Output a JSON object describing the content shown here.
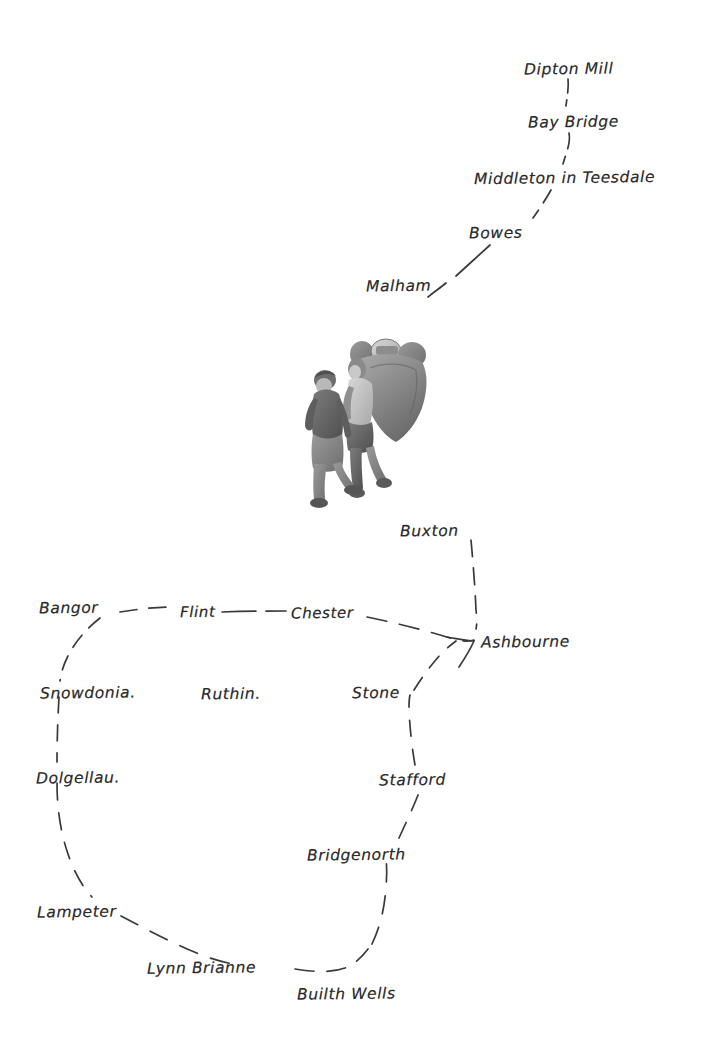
{
  "document": {
    "kind": "hand-drawn-route-map",
    "background_color": "#ffffff",
    "ink_color": "#2b2b2b"
  },
  "illustration": {
    "name": "two-hikers-walking",
    "description": "Two walkers with rucksacks, grayscale sketch",
    "x": 300,
    "y": 336,
    "width": 148,
    "height": 172
  },
  "places": [
    {
      "id": "dipton-mill",
      "label": "Dipton Mill",
      "x": 524,
      "y": 62,
      "anchor": "left"
    },
    {
      "id": "bay-bridge",
      "label": "Bay Bridge",
      "x": 528,
      "y": 115,
      "anchor": "left"
    },
    {
      "id": "middleton-in-teesdale",
      "label": "Middleton in Teesdale",
      "x": 474,
      "y": 171,
      "anchor": "left"
    },
    {
      "id": "bowes",
      "label": "Bowes",
      "x": 469,
      "y": 226,
      "anchor": "left"
    },
    {
      "id": "malham",
      "label": "Malham",
      "x": 366,
      "y": 279,
      "anchor": "left"
    },
    {
      "id": "buxton",
      "label": "Buxton",
      "x": 400,
      "y": 524,
      "anchor": "left"
    },
    {
      "id": "bangor",
      "label": "Bangor",
      "x": 39,
      "y": 601,
      "anchor": "left"
    },
    {
      "id": "flint",
      "label": "Flint",
      "x": 180,
      "y": 605,
      "anchor": "left"
    },
    {
      "id": "chester",
      "label": "Chester",
      "x": 291,
      "y": 606,
      "anchor": "left"
    },
    {
      "id": "ashbourne",
      "label": "Ashbourne",
      "x": 481,
      "y": 635,
      "anchor": "left"
    },
    {
      "id": "snowdonia",
      "label": "Snowdonia.",
      "x": 40,
      "y": 686,
      "anchor": "left"
    },
    {
      "id": "ruthin",
      "label": "Ruthin.",
      "x": 201,
      "y": 687,
      "anchor": "left"
    },
    {
      "id": "stone",
      "label": "Stone",
      "x": 352,
      "y": 686,
      "anchor": "left"
    },
    {
      "id": "dolgellau",
      "label": "Dolgellau.",
      "x": 36,
      "y": 771,
      "anchor": "left"
    },
    {
      "id": "stafford",
      "label": "Stafford",
      "x": 379,
      "y": 773,
      "anchor": "left"
    },
    {
      "id": "bridgenorth",
      "label": "Bridgenorth",
      "x": 307,
      "y": 848,
      "anchor": "left"
    },
    {
      "id": "lampeter",
      "label": "Lampeter",
      "x": 37,
      "y": 905,
      "anchor": "left"
    },
    {
      "id": "lynn-brianne",
      "label": "Lynn Brianne",
      "x": 147,
      "y": 961,
      "anchor": "left"
    },
    {
      "id": "builth-wells",
      "label": "Builth Wells",
      "x": 297,
      "y": 987,
      "anchor": "left"
    }
  ],
  "route_segments": [
    {
      "id": "dipton-mill--bay-bridge",
      "from": "dipton-mill",
      "to": "bay-bridge",
      "style": "dashed"
    },
    {
      "id": "bay-bridge--middleton-in-teesdale",
      "from": "bay-bridge",
      "to": "middleton-in-teesdale",
      "style": "dashed"
    },
    {
      "id": "middleton-in-teesdale--bowes",
      "from": "middleton-in-teesdale",
      "to": "bowes",
      "style": "dashed"
    },
    {
      "id": "bowes--malham",
      "from": "bowes",
      "to": "malham",
      "style": "dashed"
    },
    {
      "id": "buxton--ashbourne",
      "from": "buxton",
      "to": "ashbourne",
      "style": "dashed"
    },
    {
      "id": "bangor--flint",
      "from": "bangor",
      "to": "flint",
      "style": "dashed"
    },
    {
      "id": "flint--chester",
      "from": "flint",
      "to": "chester",
      "style": "dashed"
    },
    {
      "id": "chester--ashbourne",
      "from": "chester",
      "to": "ashbourne",
      "style": "dashed"
    },
    {
      "id": "bangor--snowdonia",
      "from": "bangor",
      "to": "snowdonia",
      "style": "dashed"
    },
    {
      "id": "snowdonia--dolgellau",
      "from": "snowdonia",
      "to": "dolgellau",
      "style": "dashed"
    },
    {
      "id": "dolgellau--lampeter",
      "from": "dolgellau",
      "to": "lampeter",
      "style": "dashed"
    },
    {
      "id": "lampeter--lynn-brianne",
      "from": "lampeter",
      "to": "lynn-brianne",
      "style": "dashed"
    },
    {
      "id": "lynn-brianne--builth-wells",
      "from": "lynn-brianne",
      "to": "builth-wells",
      "style": "dashed"
    },
    {
      "id": "builth-wells--bridgenorth",
      "from": "builth-wells",
      "to": "bridgenorth",
      "style": "dashed"
    },
    {
      "id": "bridgenorth--stafford",
      "from": "bridgenorth",
      "to": "stafford",
      "style": "dashed"
    },
    {
      "id": "stafford--stone",
      "from": "stafford",
      "to": "stone",
      "style": "dashed"
    },
    {
      "id": "stone--ashbourne",
      "from": "stone",
      "to": "ashbourne",
      "style": "dashed"
    }
  ]
}
